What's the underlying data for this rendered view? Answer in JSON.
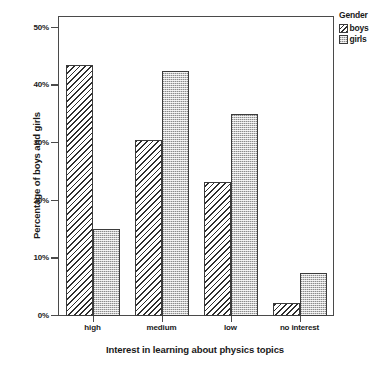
{
  "chart_data": {
    "type": "bar",
    "title": "",
    "categories": [
      "high",
      "medium",
      "low",
      "no interest"
    ],
    "series": [
      {
        "name": "boys",
        "values": [
          43.5,
          30.5,
          23.3,
          2.3
        ]
      },
      {
        "name": "girls",
        "values": [
          15.0,
          42.5,
          35.0,
          7.5
        ]
      }
    ],
    "xlabel": "Interest in learning about physics topics",
    "ylabel": "Percentage of boys and girls",
    "ylim": [
      0,
      52
    ],
    "yticks": [
      0,
      10,
      20,
      30,
      40,
      50
    ],
    "ytick_labels": [
      "0%",
      "10%",
      "20%",
      "30%",
      "40%",
      "50%"
    ],
    "grid": false,
    "legend_position": "right-top",
    "legend": {
      "title": "Gender",
      "entries": [
        {
          "label": "boys",
          "pattern": "diagonal-hatch",
          "color": "#ffffff"
        },
        {
          "label": "girls",
          "pattern": "stipple-dots",
          "color": "#c9c9c9"
        }
      ]
    },
    "axis_color": "#4a4a4a",
    "bar_outline_color": "#3b3b3b"
  }
}
